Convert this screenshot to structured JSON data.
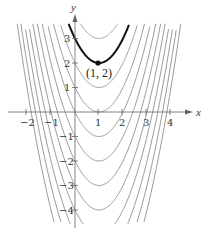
{
  "chart_data": {
    "type": "line",
    "title": "",
    "xlabel": "x",
    "ylabel": "y",
    "xlim": [
      -2.5,
      4.5
    ],
    "ylim": [
      -4.6,
      3.6
    ],
    "x_ticks": [
      -2,
      -1,
      1,
      2,
      3,
      4
    ],
    "y_ticks": [
      -4,
      -3,
      -2,
      -1,
      1,
      2,
      3
    ],
    "grid": false,
    "legend": null,
    "series": [
      {
        "name": "C = 3",
        "formula": "(x-1)^2 + 3",
        "C": 3,
        "color": "#9a9a9a",
        "highlight": false
      },
      {
        "name": "C = 2",
        "formula": "(x-1)^2 + 2",
        "C": 2,
        "color": "#111111",
        "highlight": true
      },
      {
        "name": "C = 1",
        "formula": "(x-1)^2 + 1",
        "C": 1,
        "color": "#9a9a9a",
        "highlight": false
      },
      {
        "name": "C = 0",
        "formula": "(x-1)^2",
        "C": 0,
        "color": "#9a9a9a",
        "highlight": false
      },
      {
        "name": "C = -1",
        "formula": "(x-1)^2 - 1",
        "C": -1,
        "color": "#9a9a9a",
        "highlight": false
      },
      {
        "name": "C = -2",
        "formula": "(x-1)^2 - 2",
        "C": -2,
        "color": "#9a9a9a",
        "highlight": false
      },
      {
        "name": "C = -3",
        "formula": "(x-1)^2 - 3",
        "C": -3,
        "color": "#9a9a9a",
        "highlight": false
      },
      {
        "name": "C = -4",
        "formula": "(x-1)^2 - 4",
        "C": -4,
        "color": "#9a9a9a",
        "highlight": false
      },
      {
        "name": "C = -5",
        "formula": "(x-1)^2 - 5",
        "C": -5,
        "color": "#9a9a9a",
        "highlight": false
      },
      {
        "name": "C = -6",
        "formula": "(x-1)^2 - 6",
        "C": -6,
        "color": "#9a9a9a",
        "highlight": false
      },
      {
        "name": "C = -7",
        "formula": "(x-1)^2 - 7",
        "C": -7,
        "color": "#9a9a9a",
        "highlight": false
      },
      {
        "name": "C = -8",
        "formula": "(x-1)^2 - 8",
        "C": -8,
        "color": "#9a9a9a",
        "highlight": false
      }
    ],
    "annotations": [
      {
        "text": "(1, 2)",
        "x": 1,
        "y": 2,
        "marker": "point"
      }
    ]
  },
  "labels": {
    "x_axis": "x",
    "y_axis": "y",
    "point": "(1, 2)",
    "x_ticks": [
      "−2",
      "−1",
      "1",
      "2",
      "3",
      "4"
    ],
    "y_ticks": [
      "3",
      "2",
      "1",
      "−1",
      "−2",
      "−3",
      "−4"
    ]
  }
}
